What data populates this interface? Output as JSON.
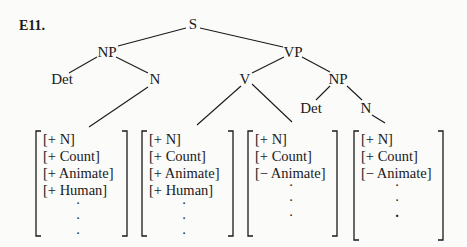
{
  "example_label": "E11.",
  "tree": {
    "nodes": {
      "S": "S",
      "NP1": "NP",
      "Det1": "Det",
      "N1": "N",
      "VP": "VP",
      "V": "V",
      "NP2": "NP",
      "Det2": "Det",
      "N2": "N"
    }
  },
  "matrices": [
    {
      "features": [
        "[+ N]",
        "[+ Count]",
        "[+ Animate]",
        "[+ Human]"
      ],
      "dots": [
        "·",
        "·",
        "·"
      ]
    },
    {
      "features": [
        "[+ N]",
        "[+ Count]",
        "[+ Animate]",
        "[+ Human]"
      ],
      "dots": [
        "·",
        "·",
        "·"
      ]
    },
    {
      "features": [
        "[+ N]",
        "[+ Count]",
        "[− Animate]"
      ],
      "dots": [
        "·",
        "·",
        "·"
      ]
    },
    {
      "features": [
        "[+ N]",
        "[+ Count]",
        "[− Animate]"
      ],
      "dots": [
        "·",
        "·",
        "·"
      ]
    }
  ]
}
